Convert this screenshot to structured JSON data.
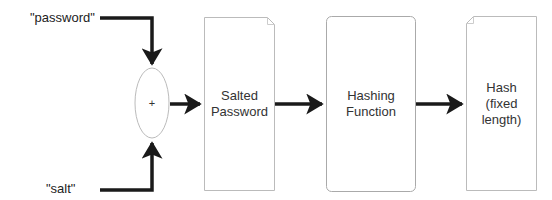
{
  "diagram": {
    "inputs": {
      "password_label": "\"password\"",
      "salt_label": "\"salt\""
    },
    "combine_node": {
      "symbol": "+"
    },
    "nodes": [
      {
        "id": "salted-password",
        "shape": "document",
        "text": "Salted\nPassword"
      },
      {
        "id": "hashing-function",
        "shape": "rounded-rectangle",
        "text": "Hashing\nFunction"
      },
      {
        "id": "hash",
        "shape": "document",
        "text": "Hash\n(fixed\nlength)"
      }
    ],
    "edges": [
      {
        "from": "\"password\"",
        "to": "+"
      },
      {
        "from": "\"salt\"",
        "to": "+"
      },
      {
        "from": "+",
        "to": "Salted Password"
      },
      {
        "from": "Salted Password",
        "to": "Hashing Function"
      },
      {
        "from": "Hashing Function",
        "to": "Hash (fixed length)"
      }
    ],
    "colors": {
      "arrow": "#1a1a1a",
      "node_border": "#bbbbbb",
      "text": "#333333"
    }
  }
}
